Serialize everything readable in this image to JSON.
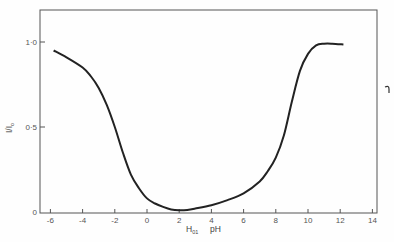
{
  "chart_data": {
    "type": "line",
    "title": "",
    "xlabel": "H₀₁   pH",
    "xlabel_parts": {
      "h_label": "H",
      "h_subscript": "01",
      "ph_label": "pH"
    },
    "ylabel": "I/I₀",
    "ylabel_parts": {
      "main": "I/I",
      "subscript": "o"
    },
    "xlim": [
      -6.6,
      14
    ],
    "ylim": [
      0,
      1.2
    ],
    "x_ticks": [
      -6,
      -4,
      -2,
      0,
      2,
      4,
      6,
      8,
      10,
      12,
      14
    ],
    "x_tick_labels": [
      "-6",
      "-4",
      "-2",
      "0",
      "2",
      "4",
      "6",
      "8",
      "10",
      "12",
      "14"
    ],
    "y_ticks": [
      0,
      0.5,
      1.0
    ],
    "y_tick_labels": [
      "0",
      "0·5",
      "1·0"
    ],
    "grid": false,
    "legend": null,
    "series": [
      {
        "name": "I/Io",
        "x": [
          -5.8,
          -5,
          -4,
          -3.5,
          -3,
          -2.5,
          -2,
          -1.5,
          -1,
          -0.5,
          0,
          0.5,
          1,
          1.5,
          2,
          2.5,
          3,
          4,
          5,
          6,
          7,
          7.5,
          8,
          8.5,
          9,
          9.5,
          10,
          10.5,
          11,
          11.5,
          12.2
        ],
        "y": [
          0.95,
          0.91,
          0.85,
          0.8,
          0.73,
          0.63,
          0.5,
          0.35,
          0.22,
          0.14,
          0.08,
          0.05,
          0.03,
          0.015,
          0.01,
          0.012,
          0.02,
          0.04,
          0.07,
          0.11,
          0.18,
          0.24,
          0.32,
          0.45,
          0.65,
          0.83,
          0.93,
          0.98,
          0.99,
          0.99,
          0.985
        ]
      }
    ],
    "annotations": [
      "⌐ mark at right margin"
    ]
  }
}
